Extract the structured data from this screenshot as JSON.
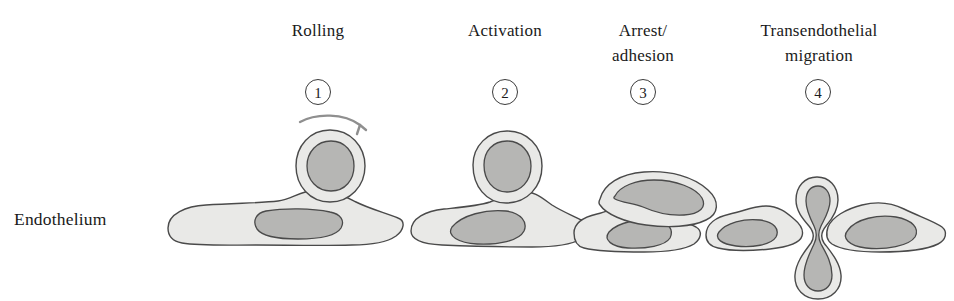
{
  "figure": {
    "type": "biological-process-diagram",
    "axis_label_left": "Endothelium"
  },
  "palette": {
    "outline": "#4a4a4a",
    "cytoplasm": "#e9e9e7",
    "nucleus": "#b6b6b4",
    "text": "#1a1a1a",
    "arrow": "#8f8f8f",
    "background": "#ffffff"
  },
  "stages": [
    {
      "number": "1",
      "label": "Rolling",
      "label_lines": 1,
      "has_arrow": true,
      "leukocyte_state": "round-rolling"
    },
    {
      "number": "2",
      "label": "Activation",
      "label_lines": 1,
      "has_arrow": false,
      "leukocyte_state": "round-attached"
    },
    {
      "number": "3",
      "label": "Arrest/\nadhesion",
      "label_lines": 2,
      "has_arrow": false,
      "leukocyte_state": "flattened-spread"
    },
    {
      "number": "4",
      "label": "Transendothelial\nmigration",
      "label_lines": 2,
      "has_arrow": false,
      "leukocyte_state": "diapedesis-hourglass"
    }
  ]
}
